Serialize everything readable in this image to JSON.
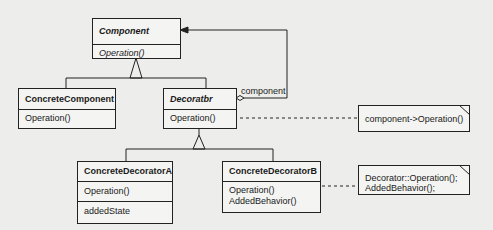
{
  "diagram": {
    "type": "UML class diagram",
    "classes": {
      "component": {
        "name": "Component",
        "abstract": true,
        "operations": [
          "Operation()"
        ]
      },
      "concrete_component": {
        "name": "ConcreteComponent",
        "abstract": false,
        "operations": [
          "Operation()"
        ]
      },
      "decorator": {
        "name": "Decoratbr",
        "abstract": true,
        "operations": [
          "Operation()"
        ]
      },
      "concrete_decorator_a": {
        "name": "ConcreteDecoratorA",
        "abstract": false,
        "operations": [
          "Operation()"
        ],
        "attributes": [
          "addedState"
        ]
      },
      "concrete_decorator_b": {
        "name": "ConcreteDecoratorB",
        "abstract": false,
        "operations": [
          "Operation()",
          "AddedBehavior()"
        ]
      }
    },
    "associations": {
      "decorator_component": {
        "label": "component",
        "kind": "aggregation",
        "from": "Decoratbr",
        "to": "Component"
      }
    },
    "notes": {
      "decorator_note": {
        "lines": [
          "component->Operation()"
        ]
      },
      "decorator_b_note": {
        "lines": [
          "Decorator::Operation();",
          "AddedBehavior();"
        ]
      }
    },
    "colors": {
      "line": "#222222",
      "background": "#ededeb",
      "box": "#f4f4f2"
    }
  }
}
